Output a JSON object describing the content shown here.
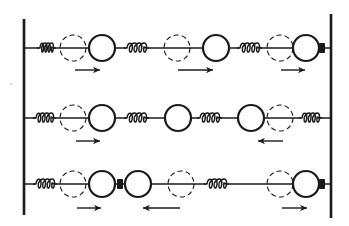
{
  "figure": {
    "colors": {
      "ink": "#1a1a1a",
      "background": "#ffffff"
    },
    "walls": {
      "left_x": 24,
      "left_top": 19,
      "left_bottom": 215,
      "right_x": 331,
      "right_top": 14,
      "right_bottom": 218
    },
    "rows": [
      {
        "y": 48,
        "arrow_y": 70,
        "springs": [
          {
            "x1": 37,
            "x2": 56
          },
          {
            "x1": 124,
            "x2": 149
          },
          {
            "x1": 237,
            "x2": 262
          }
        ],
        "dashed_circles": [
          {
            "cx": 73,
            "r": 13
          },
          {
            "cx": 177,
            "r": 13
          },
          {
            "cx": 280,
            "r": 13
          }
        ],
        "solid_circles": [
          {
            "cx": 102,
            "r": 13
          },
          {
            "cx": 216,
            "r": 13
          },
          {
            "cx": 306,
            "r": 13
          }
        ],
        "blocks": [
          {
            "cx": 322
          }
        ],
        "arrows": [
          {
            "x1": 75,
            "x2": 100,
            "direction": "right"
          },
          {
            "x1": 178,
            "x2": 213,
            "direction": "right"
          },
          {
            "x1": 281,
            "x2": 305,
            "direction": "right"
          }
        ]
      },
      {
        "y": 118,
        "arrow_y": 141,
        "springs": [
          {
            "x1": 33,
            "x2": 56
          },
          {
            "x1": 124,
            "x2": 149
          },
          {
            "x1": 197,
            "x2": 222
          },
          {
            "x1": 299,
            "x2": 322
          }
        ],
        "dashed_circles": [
          {
            "cx": 73,
            "r": 13
          },
          {
            "cx": 280,
            "r": 13
          }
        ],
        "solid_circles": [
          {
            "cx": 102,
            "r": 13
          },
          {
            "cx": 178,
            "r": 13
          },
          {
            "cx": 251,
            "r": 13
          }
        ],
        "blocks": [],
        "arrows": [
          {
            "x1": 76,
            "x2": 100,
            "direction": "right"
          },
          {
            "x1": 258,
            "x2": 283,
            "direction": "left"
          }
        ]
      },
      {
        "y": 184,
        "arrow_y": 208,
        "springs": [
          {
            "x1": 33,
            "x2": 57
          },
          {
            "x1": 204,
            "x2": 229
          }
        ],
        "dashed_circles": [
          {
            "cx": 73,
            "r": 13
          },
          {
            "cx": 181,
            "r": 13
          },
          {
            "cx": 280,
            "r": 13
          }
        ],
        "solid_circles": [
          {
            "cx": 102,
            "r": 13
          },
          {
            "cx": 138,
            "r": 13
          },
          {
            "cx": 306,
            "r": 13
          }
        ],
        "blocks": [
          {
            "cx": 120
          },
          {
            "cx": 322
          }
        ],
        "arrows": [
          {
            "x1": 77,
            "x2": 101,
            "direction": "right"
          },
          {
            "x1": 143,
            "x2": 180,
            "direction": "left"
          },
          {
            "x1": 282,
            "x2": 307,
            "direction": "right"
          }
        ]
      }
    ],
    "stray_mark": {
      "x": 11,
      "y": 84
    }
  }
}
